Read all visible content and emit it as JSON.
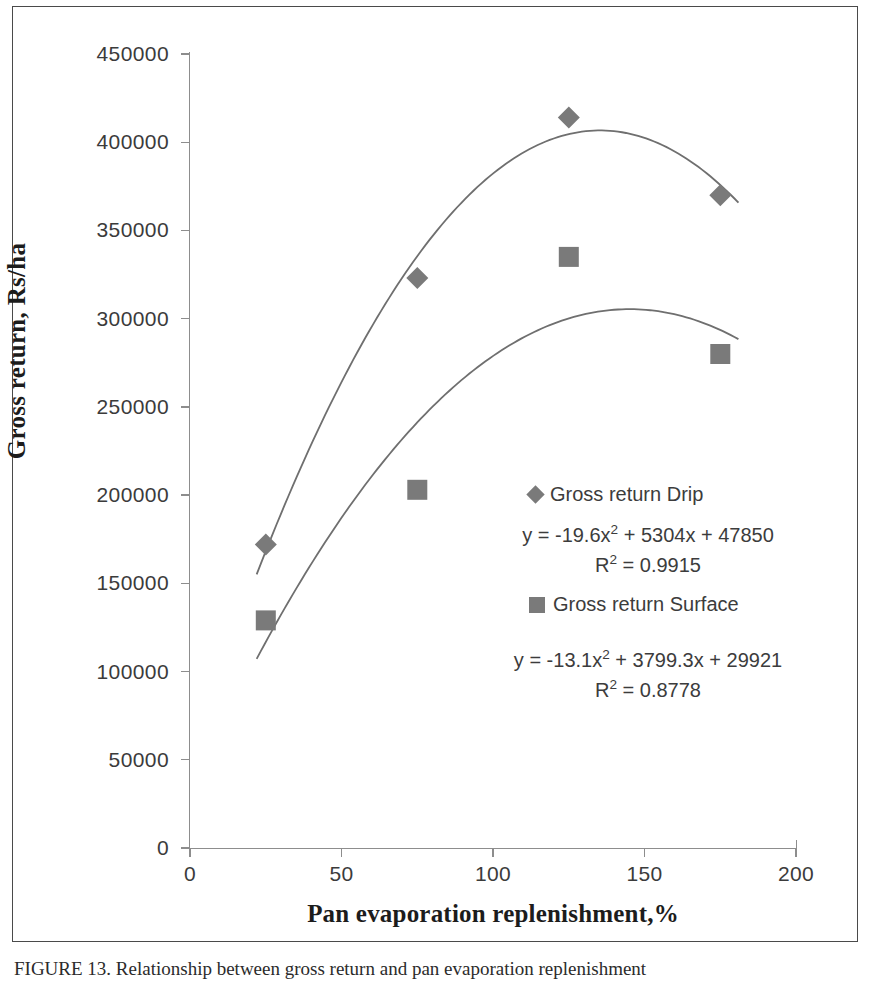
{
  "figure": {
    "caption": "FIGURE 13.  Relationship between gross return and pan evaporation replenishment"
  },
  "chart_data": {
    "type": "scatter",
    "title": "",
    "xlabel": "Pan evaporation replenishment,%",
    "ylabel": "Gross return, Rs/ha",
    "xlim": [
      0,
      200
    ],
    "ylim": [
      0,
      450000
    ],
    "xticks": [
      "0",
      "50",
      "100",
      "150",
      "200"
    ],
    "xtick_values": [
      0,
      50,
      100,
      150,
      200
    ],
    "yticks": [
      "0",
      "50000",
      "100000",
      "150000",
      "200000",
      "250000",
      "300000",
      "350000",
      "400000",
      "450000"
    ],
    "ytick_values": [
      0,
      50000,
      100000,
      150000,
      200000,
      250000,
      300000,
      350000,
      400000,
      450000
    ],
    "grid": false,
    "legend_position": "inside-right",
    "series": [
      {
        "name": "Gross return Drip",
        "marker": "diamond",
        "color": "#7a7a7a",
        "x": [
          25,
          75,
          125,
          175
        ],
        "values": [
          172000,
          323000,
          414000,
          370000
        ],
        "trendline": {
          "equation": "y = -19.6x² + 5304x + 47850",
          "r_squared": "R² = 0.9915",
          "a": -19.6,
          "b": 5304,
          "c": 47850
        }
      },
      {
        "name": "Gross return Surface",
        "marker": "square",
        "color": "#7a7a7a",
        "x": [
          25,
          75,
          125,
          175
        ],
        "values": [
          129000,
          203000,
          335000,
          280000
        ],
        "trendline": {
          "equation": "y = -13.1x² + 3799.3x + 29921",
          "r_squared": "R² = 0.8778",
          "a": -13.1,
          "b": 3799.3,
          "c": 29921
        }
      }
    ]
  },
  "legend": {
    "drip_label": "Gross return Drip",
    "surface_label": "Gross return Surface"
  },
  "annotations": {
    "drip_equation": "y = -19.6x² + 5304x + 47850",
    "drip_r2": "R² = 0.9915",
    "surface_equation": "y = -13.1x² + 3799.3x + 29921",
    "surface_r2": "R² = 0.8778"
  },
  "colors": {
    "marker": "#7a7a7a",
    "curve": "#6f6f6f",
    "axis": "#8d8d8d",
    "frame": "#4a4a4a",
    "text": "#3c3c3c"
  }
}
